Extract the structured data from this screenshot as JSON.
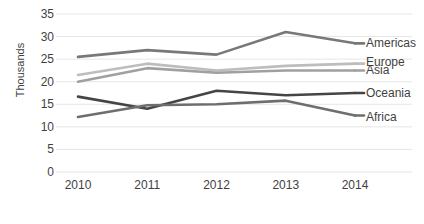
{
  "chart_data": {
    "type": "line",
    "title": "",
    "xlabel": "",
    "ylabel": "Thousands",
    "categories": [
      "2010",
      "2011",
      "2012",
      "2013",
      "2014"
    ],
    "ylim": [
      0,
      35
    ],
    "ytick_step": 5,
    "yticks": [
      "0",
      "5",
      "10",
      "15",
      "20",
      "25",
      "30",
      "35"
    ],
    "grid": true,
    "legend_position": "right-of-plot-at-line-end",
    "series": [
      {
        "name": "Americas",
        "color": "#787878",
        "values": [
          25.5,
          27.0,
          26.0,
          31.0,
          28.5
        ]
      },
      {
        "name": "Europe",
        "color": "#bdbdbd",
        "values": [
          21.5,
          24.0,
          22.5,
          23.5,
          24.0
        ]
      },
      {
        "name": "Asia",
        "color": "#a0a0a0",
        "values": [
          20.0,
          23.0,
          22.0,
          22.5,
          22.5
        ]
      },
      {
        "name": "Oceania",
        "color": "#454545",
        "values": [
          16.7,
          14.0,
          18.0,
          17.0,
          17.5
        ]
      },
      {
        "name": "Africa",
        "color": "#6e6e6e",
        "values": [
          12.2,
          14.8,
          15.0,
          15.8,
          12.5
        ]
      }
    ]
  },
  "legend": {
    "items": [
      {
        "label": "Americas"
      },
      {
        "label": "Europe"
      },
      {
        "label": "Asia"
      },
      {
        "label": "Oceania"
      },
      {
        "label": "Africa"
      }
    ]
  },
  "axes": {
    "y_title": "Thousands",
    "grid_color": "#e6e6e6"
  }
}
